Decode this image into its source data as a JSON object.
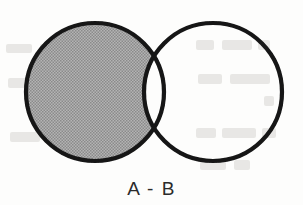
{
  "figure": {
    "kind": "venn-diagram",
    "caption": "A - B",
    "caption_left": 0,
    "caption_top": 178,
    "background_color": "#fdfdfc",
    "stroke_color": "#141414",
    "stroke_width": 4.2,
    "shaded_fill_color": "#a2a2a2",
    "unshaded_fill_color": "#ffffff",
    "width": 303,
    "height": 205
  },
  "sets": [
    {
      "id": "set-a",
      "label": "A",
      "cx": 95,
      "cy": 92,
      "r": 69,
      "shaded": true,
      "fill": "#a2a2a2"
    },
    {
      "id": "set-b",
      "label": "B",
      "cx": 213,
      "cy": 92,
      "r": 69,
      "shaded": false,
      "fill": "#ffffff"
    }
  ],
  "regions": {
    "a_only": {
      "name": "A only",
      "shaded": true
    },
    "intersection": {
      "name": "A and B",
      "shaded": false
    },
    "b_only": {
      "name": "B only",
      "shaded": false
    }
  },
  "intersection_points": {
    "top": {
      "x": 154,
      "y": 32
    },
    "bottom": {
      "x": 154,
      "y": 152
    }
  },
  "chart_data": {
    "type": "venn",
    "title": "A - B",
    "sets": [
      "A",
      "B"
    ],
    "shaded_regions": [
      "A only"
    ],
    "unshaded_regions": [
      "A and B",
      "B only"
    ],
    "operation": "difference"
  }
}
